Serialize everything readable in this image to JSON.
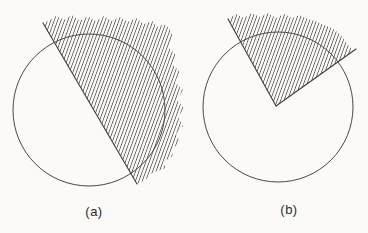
{
  "page": {
    "background": "#fbfaf8"
  },
  "labels": {
    "fig_a": "(a)",
    "fig_b": "(b)"
  },
  "style": {
    "line_color": "#4b4843",
    "edge_color": "#403d39",
    "hatch_color": "#4d4a45",
    "hatch_spacing": 3.2,
    "hatch_tile_height": 8,
    "hatch_angle_deg": 20,
    "circle_stroke_width": 1,
    "edge_stroke_width": 1.1,
    "hatch_stroke_width": 0.8
  },
  "figures": [
    {
      "id": "a",
      "caption": "(a)",
      "circle": {
        "cx": 89,
        "cy": 110,
        "r": 76
      },
      "hatch_region": [
        [
          43,
          23
        ],
        [
          50,
          20
        ],
        [
          56,
          16
        ],
        [
          64,
          20
        ],
        [
          72,
          15
        ],
        [
          80,
          21
        ],
        [
          88,
          16
        ],
        [
          96,
          21
        ],
        [
          104,
          16
        ],
        [
          112,
          21
        ],
        [
          120,
          17
        ],
        [
          128,
          22
        ],
        [
          136,
          18
        ],
        [
          144,
          24
        ],
        [
          152,
          21
        ],
        [
          158,
          27
        ],
        [
          164,
          24
        ],
        [
          170,
          29
        ],
        [
          173,
          37
        ],
        [
          168,
          47
        ],
        [
          176,
          55
        ],
        [
          172,
          64
        ],
        [
          180,
          72
        ],
        [
          175,
          82
        ],
        [
          183,
          90
        ],
        [
          177,
          100
        ],
        [
          184,
          108
        ],
        [
          178,
          117
        ],
        [
          183,
          126
        ],
        [
          176,
          134
        ],
        [
          180,
          142
        ],
        [
          171,
          150
        ],
        [
          173,
          156
        ],
        [
          163,
          162
        ],
        [
          166,
          168
        ],
        [
          152,
          173
        ],
        [
          148,
          178
        ],
        [
          137,
          184
        ]
      ],
      "edges": [
        [
          [
            43,
            23
          ],
          [
            137,
            184
          ]
        ]
      ]
    },
    {
      "id": "b",
      "caption": "(b)",
      "circle": {
        "cx": 278,
        "cy": 107,
        "r": 75
      },
      "hatch_region": [
        [
          276,
          106
        ],
        [
          228,
          19
        ],
        [
          236,
          14
        ],
        [
          244,
          18
        ],
        [
          252,
          13
        ],
        [
          260,
          17
        ],
        [
          268,
          13
        ],
        [
          276,
          18
        ],
        [
          284,
          14
        ],
        [
          292,
          18
        ],
        [
          300,
          15
        ],
        [
          308,
          19
        ],
        [
          316,
          21
        ],
        [
          324,
          25
        ],
        [
          332,
          28
        ],
        [
          340,
          34
        ],
        [
          346,
          42
        ],
        [
          353,
          51
        ]
      ],
      "edges": [
        [
          [
            228,
            19
          ],
          [
            276,
            106
          ]
        ],
        [
          [
            276,
            106
          ],
          [
            356,
            49
          ]
        ]
      ]
    }
  ]
}
